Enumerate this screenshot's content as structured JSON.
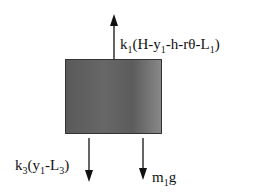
{
  "diagram": {
    "type": "free-body-diagram",
    "body": {
      "label": "mass block",
      "color": "#606060"
    },
    "forces": [
      {
        "id": "spring1",
        "direction": "up",
        "k": "k",
        "k_sub": "1",
        "expr_pre": "(H-y",
        "y_sub": "1",
        "expr_post": "-h-rθ-L",
        "L_sub": "1",
        "close": ")"
      },
      {
        "id": "spring3",
        "direction": "down",
        "k": "k",
        "k_sub": "3",
        "expr_pre": "(y",
        "y_sub": "1",
        "expr_post": "-L",
        "L_sub": "3",
        "close": ")"
      },
      {
        "id": "weight",
        "direction": "down",
        "m": "m",
        "m_sub": "1",
        "g": "g"
      }
    ]
  }
}
